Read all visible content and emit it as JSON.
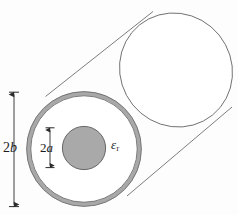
{
  "figure": {
    "name": "coaxial-dielectric-cylinder",
    "caption": "",
    "background_color": "#fdfdfd",
    "labels": {
      "outer_diameter": {
        "number": "2",
        "symbol": "b",
        "full": "2b"
      },
      "inner_diameter": {
        "number": "2",
        "symbol": "a",
        "full": "2a"
      },
      "permittivity": {
        "symbol": "ε",
        "subscript": "r",
        "full": "εr"
      }
    },
    "geometry": {
      "outer_circle": {
        "cx": 84,
        "cy": 149,
        "r": 57.5,
        "shell_thickness": 4.2
      },
      "inner_circle": {
        "cx": 84,
        "cy": 148,
        "r": 21.5
      },
      "far_ellipse": {
        "cx": 176,
        "cy": 70,
        "rx": 55,
        "ry": 58,
        "rotation_deg": -40
      },
      "tangent_top": {
        "x1": 46,
        "y1": 95,
        "x2": 152,
        "y2": 12
      },
      "tangent_bottom": {
        "x1": 129,
        "y1": 194,
        "x2": 231,
        "y2": 108
      }
    },
    "colors": {
      "shell_fill": "#a8a8a8",
      "inner_fill": "#a9a9a9",
      "outline": "#5a5a5a",
      "body_outline": "#6e6e6e",
      "annulus_fill": "#ffffff",
      "text": "#1c1c1c",
      "arrow": "#2b2b2b"
    },
    "dimension_arrows": {
      "outer": {
        "x": 14,
        "y_top": 92,
        "y_bottom": 207,
        "label": "2b"
      },
      "inner": {
        "x": 50,
        "y_top": 128,
        "y_bottom": 168,
        "label": "2a"
      }
    }
  }
}
